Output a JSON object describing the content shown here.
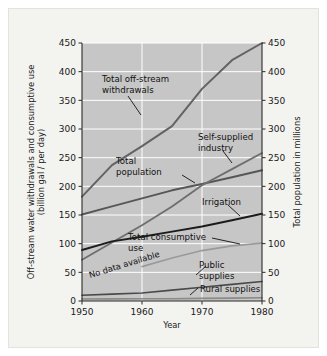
{
  "chart_data": {
    "type": "line",
    "title": "",
    "subtitle": "",
    "xlabel": "Year",
    "ylabel": "Off-stream water withdrawals and consumptive use\n(billion gal / per day)",
    "ylabel_line1": "Off-stream water withdrawals and consumptive use",
    "ylabel_line2": "(billion gal / per day)",
    "y2label": "Total population in millions",
    "xlim": [
      1950,
      1980
    ],
    "ylim": [
      0,
      450
    ],
    "y2lim": [
      0,
      450
    ],
    "xticks": [
      "1950",
      "1960",
      "1970",
      "1980"
    ],
    "xtick_values": [
      1950,
      1960,
      1970,
      1980
    ],
    "yticks": [
      "0",
      "50",
      "100",
      "150",
      "200",
      "250",
      "300",
      "350",
      "400",
      "450"
    ],
    "ytick_values": [
      0,
      50,
      100,
      150,
      200,
      250,
      300,
      350,
      400,
      450
    ],
    "y2ticks": [
      "0",
      "50",
      "100",
      "150",
      "200",
      "250",
      "300",
      "350",
      "400",
      "450"
    ],
    "y2tick_values": [
      0,
      50,
      100,
      150,
      200,
      250,
      300,
      350,
      400,
      450
    ],
    "grid": true,
    "grid_color": "#ffffff",
    "plot_background": "#c6c6c6",
    "legend_position": "inline-annotations",
    "x": [
      1950,
      1955,
      1960,
      1965,
      1970,
      1975,
      1980
    ],
    "series": [
      {
        "name": "Total off-stream withdrawals",
        "label": "Total off-stream withdrawals",
        "label_line1": "Total off-stream",
        "label_line2": "withdrawals",
        "axis": "left",
        "color": "#636363",
        "width": 2.0,
        "values": [
          182,
          237,
          270,
          305,
          370,
          420,
          450
        ]
      },
      {
        "name": "Total population",
        "label": "Total population",
        "label_line1": "Total",
        "label_line2": "population",
        "axis": "right",
        "color": "#575757",
        "width": 2.0,
        "values": [
          151,
          165,
          179,
          193,
          204,
          216,
          228
        ]
      },
      {
        "name": "Self-supplied industry",
        "label": "Self-supplied industry",
        "label_line1": "Self-supplied",
        "label_line2": "industry",
        "axis": "left",
        "color": "#6e6e6e",
        "width": 1.8,
        "values": [
          72,
          102,
          132,
          165,
          202,
          230,
          258
        ]
      },
      {
        "name": "Irrigation",
        "label": "Irrigation",
        "label_line1": "Irrigation",
        "label_line2": "",
        "axis": "left",
        "color": "#1c1c1c",
        "width": 2.0,
        "values": [
          89,
          104,
          112,
          121,
          130,
          141,
          152
        ]
      },
      {
        "name": "Total consumptive use",
        "label": "Total consumptive use",
        "label_line1": "Total consumptive",
        "label_line2": "use",
        "axis": "left",
        "color": "#9a9a9a",
        "width": 1.7,
        "values": [
          null,
          null,
          60,
          75,
          88,
          96,
          101
        ]
      },
      {
        "name": "Public supplies",
        "label": "Public supplies",
        "label_line1": "Public",
        "label_line2": "supplies",
        "axis": "left",
        "color": "#4a4a4a",
        "width": 1.6,
        "values": [
          10,
          12,
          14,
          19,
          24,
          29,
          34
        ]
      },
      {
        "name": "Rural supplies",
        "label": "Rural supplies",
        "label_line1": "Rural supplies",
        "label_line2": "",
        "axis": "left",
        "color": "#8a8a8a",
        "width": 1.6,
        "values": [
          3.6,
          3.7,
          3.8,
          4.0,
          4.5,
          5.0,
          5.6
        ]
      }
    ],
    "annotations": [
      {
        "name": "no-data-available",
        "text": "No data available",
        "rotation": -17,
        "note": "Diagonal note in lower-left indicating missing consumptive-use data before 1960"
      }
    ]
  }
}
